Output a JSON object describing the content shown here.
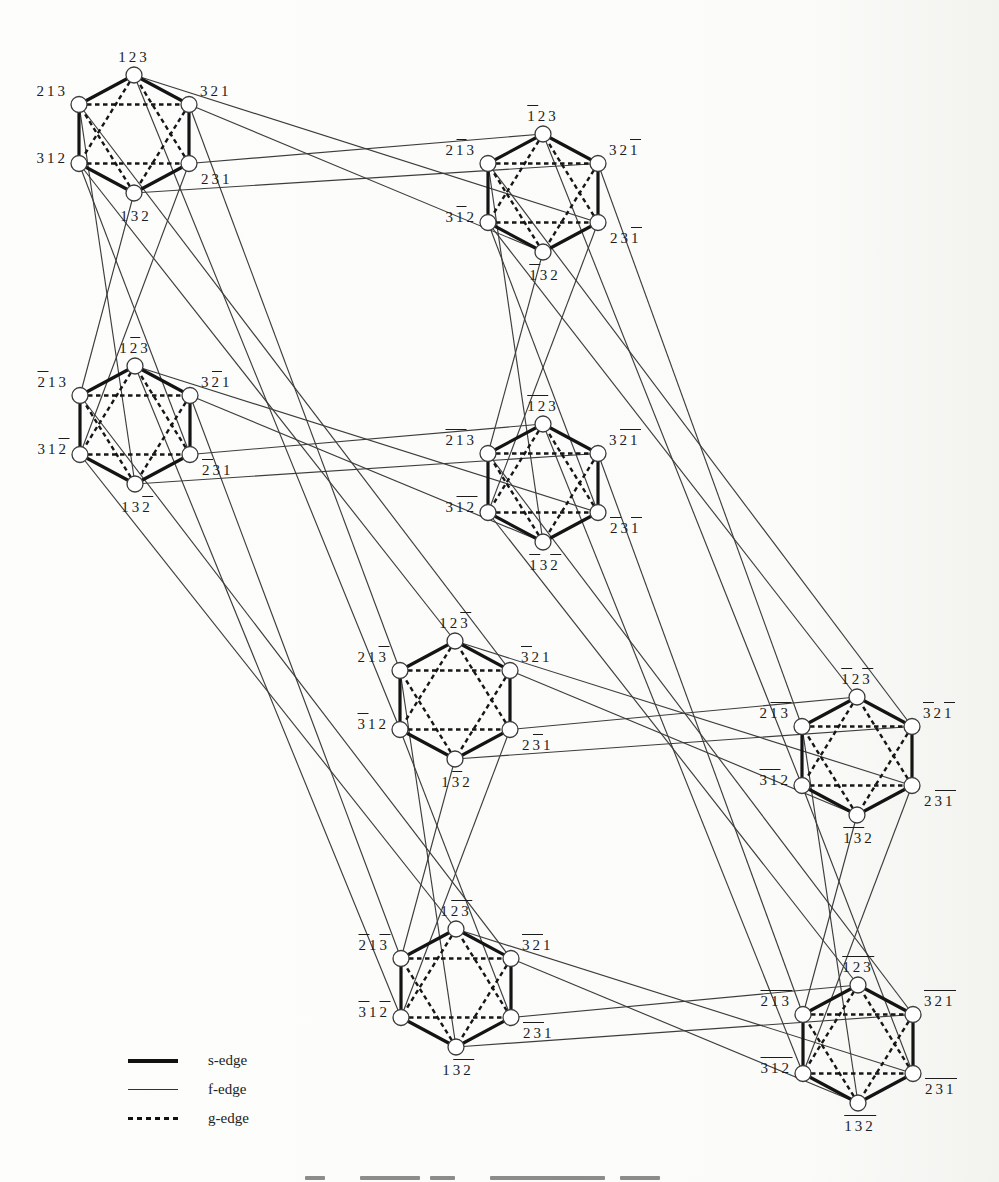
{
  "figure": {
    "legend": {
      "items": [
        {
          "label": "s-edge",
          "style": "thick-solid"
        },
        {
          "label": "f-edge",
          "style": "thin-solid"
        },
        {
          "label": "g-edge",
          "style": "dashed"
        }
      ]
    },
    "geometry": {
      "rx": 55,
      "ry": 59,
      "node_radius": 8
    },
    "vertex_positions": [
      "T",
      "UL",
      "UR",
      "LL",
      "LR",
      "B"
    ],
    "hexagons": [
      {
        "id": "H1",
        "cx": 134,
        "cy": 134,
        "labels": {
          "T": "123",
          "UL": "213",
          "UR": "321",
          "LL": "312",
          "LR": "231",
          "B": "132"
        }
      },
      {
        "id": "H2",
        "cx": 543,
        "cy": 193,
        "labels": {
          "T": "1̄23",
          "UL": "21̄3",
          "UR": "321̄",
          "LL": "31̄2",
          "LR": "231̄",
          "B": "1̄32"
        }
      },
      {
        "id": "H3",
        "cx": 135,
        "cy": 425,
        "labels": {
          "T": "12̄3",
          "UL": "2̄13",
          "UR": "32̄1",
          "LL": "312̄",
          "LR": "2̄31",
          "B": "132̄"
        }
      },
      {
        "id": "H4",
        "cx": 543,
        "cy": 483,
        "labels": {
          "T": "1̄2̄3",
          "UL": "2̄1̄3",
          "UR": "32̄1̄",
          "LL": "31̄2̄",
          "LR": "2̄31̄",
          "B": "1̄32̄"
        }
      },
      {
        "id": "H5",
        "cx": 455,
        "cy": 700,
        "labels": {
          "T": "123̄",
          "UL": "213̄",
          "UR": "3̄21",
          "LL": "3̄12",
          "LR": "23̄1",
          "B": "13̄2"
        }
      },
      {
        "id": "H6",
        "cx": 857,
        "cy": 756,
        "labels": {
          "T": "1̄23̄",
          "UL": "21̄3̄",
          "UR": "3̄21̄",
          "LL": "3̄1̄2",
          "LR": "23̄1̄",
          "B": "1̄3̄2"
        }
      },
      {
        "id": "H7",
        "cx": 456,
        "cy": 988,
        "labels": {
          "T": "12̄3̄",
          "UL": "2̄13̄",
          "UR": "3̄2̄1",
          "LL": "3̄12̄",
          "LR": "2̄3̄1",
          "B": "13̄2̄"
        }
      },
      {
        "id": "H8",
        "cx": 858,
        "cy": 1044,
        "labels": {
          "T": "1̄2̄3̄",
          "UL": "2̄1̄3̄",
          "UR": "3̄2̄1̄",
          "LL": "3̄1̄2̄",
          "LR": "2̄3̄1̄",
          "B": "1̄3̄2̄"
        }
      }
    ],
    "s_cycle": [
      "T",
      "UR",
      "LR",
      "B",
      "LL",
      "UL"
    ],
    "g_pairs": [
      [
        "T",
        "LL"
      ],
      [
        "LL",
        "LR"
      ],
      [
        "LR",
        "T"
      ],
      [
        "B",
        "UL"
      ],
      [
        "UL",
        "UR"
      ],
      [
        "UR",
        "B"
      ]
    ],
    "f_rules": [
      {
        "from": "T",
        "to": "LL",
        "toggle": 3
      },
      {
        "from": "UL",
        "to": "UR",
        "toggle": 3
      },
      {
        "from": "UR",
        "to": "B",
        "toggle": 1
      },
      {
        "from": "LR",
        "to": "T",
        "toggle": 1
      },
      {
        "from": "LL",
        "to": "LR",
        "toggle": 2
      },
      {
        "from": "B",
        "to": "UL",
        "toggle": 2
      }
    ],
    "colors": {
      "edge_dark": "#141414",
      "edge_thin": "#3d3d3d",
      "label": "#1c1c1c",
      "background": "#fdfdfc"
    },
    "footer": {
      "caption_cropped": true,
      "marks": [
        [
          305,
          20
        ],
        [
          360,
          60
        ],
        [
          430,
          25
        ],
        [
          490,
          115
        ],
        [
          620,
          40
        ]
      ]
    }
  }
}
